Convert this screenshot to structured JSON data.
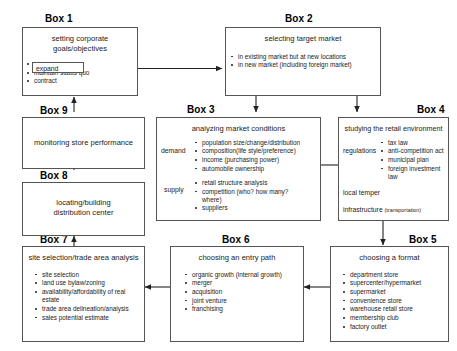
{
  "diagram": {
    "boxes": {
      "box1": {
        "label": "Box 1",
        "title": "setting corporate\ngoals/objectives",
        "title_line1": "setting corporate",
        "title_line2": "goals/objectives",
        "items": [
          "expand",
          "maintain status quo",
          "contract"
        ],
        "highlighted_item": "expand"
      },
      "box2": {
        "label": "Box 2",
        "title": "selecting target market",
        "items": [
          "in existing market but at new locations",
          "in new market (including foreign market)"
        ]
      },
      "box3": {
        "label": "Box 3",
        "title": "analyzing market conditions",
        "group1_label": "demand",
        "group1_items": [
          "population size/change/distribution",
          "composition(life style/preference)",
          "income (purchasing power)",
          "automobile ownership"
        ],
        "group2_label": "supply",
        "group2_items": [
          "retail structure analysis",
          "competition (who? how many? where)",
          "suppliers"
        ]
      },
      "box4": {
        "label": "Box 4",
        "title": "studying the retail environment",
        "group1_label": "regulations",
        "group1_items": [
          "tax law",
          "anti-competition act",
          "municipal plan",
          "foreign investment law"
        ],
        "line2": "local temper",
        "line3": "infrastructure",
        "line3_note": "(transportation)"
      },
      "box5": {
        "label": "Box 5",
        "title": "choosing a format",
        "items": [
          "department store",
          "supercenter/hypermarket",
          "supermarket",
          "convenience store",
          "warehouse retail store",
          "membership club",
          "factory outlet"
        ]
      },
      "box6": {
        "label": "Box 6",
        "title": "choosing an entry path",
        "items": [
          "organic growth (internal growth)",
          "merger",
          "acquisition",
          "joint venture",
          "franchising"
        ]
      },
      "box7": {
        "label": "Box 7",
        "title": "site selection/trade area analysis",
        "items": [
          "site selection",
          "land use bylaw/zoning",
          "availability/affordability of real estate",
          "trade area delineation/analysis",
          "sales potential estimate"
        ]
      },
      "box8": {
        "label": "Box 8",
        "title_line1": "locating/building",
        "title_line2": "distribution center"
      },
      "box9": {
        "label": "Box 9",
        "title": "monitoring store performance"
      }
    },
    "colors": {
      "box_border": "#555555",
      "arrow": "#222222",
      "text": "#222222",
      "background": "#ffffff"
    }
  }
}
